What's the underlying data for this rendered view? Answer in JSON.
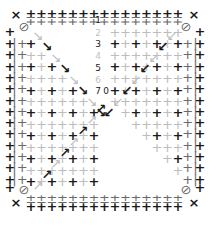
{
  "pattern": {
    "description": "Symmetric grid of plus-sign glyphs with diagonal arrow marks and numbered center column",
    "colors": {
      "dark": "#1a1a1a",
      "mid": "#6a6a6a",
      "light": "#bdbdbd",
      "background": "#ffffff"
    },
    "center_labels": [
      {
        "text": "1",
        "x": 98,
        "y": 20,
        "tone": "strong"
      },
      {
        "text": "2",
        "x": 98,
        "y": 33,
        "tone": "faint"
      },
      {
        "text": "3",
        "x": 98,
        "y": 44,
        "tone": "strong"
      },
      {
        "text": "4",
        "x": 98,
        "y": 56,
        "tone": "faint"
      },
      {
        "text": "5",
        "x": 98,
        "y": 68,
        "tone": "strong"
      },
      {
        "text": "6",
        "x": 98,
        "y": 80,
        "tone": "faint"
      },
      {
        "text": "7",
        "x": 98,
        "y": 91,
        "tone": "strong"
      },
      {
        "text": "0",
        "x": 106,
        "y": 91,
        "tone": "strong"
      }
    ],
    "corner_marks": [
      {
        "glyph": "×",
        "x": 16,
        "y": 15,
        "icon": "close-x-icon"
      },
      {
        "glyph": "×",
        "x": 194,
        "y": 15,
        "icon": "close-x-icon"
      },
      {
        "glyph": "×",
        "x": 16,
        "y": 203,
        "icon": "close-x-icon"
      },
      {
        "glyph": "×",
        "x": 194,
        "y": 203,
        "icon": "close-x-icon"
      }
    ]
  }
}
